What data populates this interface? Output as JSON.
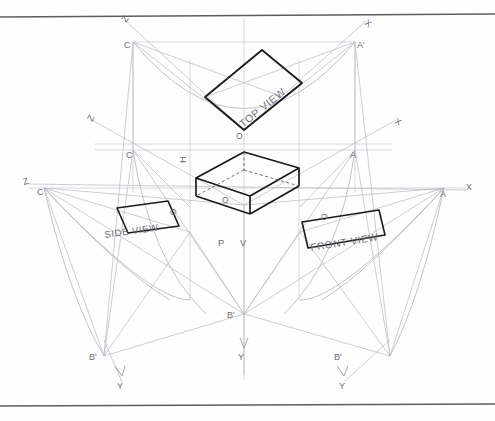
{
  "drawing": {
    "title": "Isometric projection with orthographic views layout",
    "background": "#fefefe",
    "ink": {
      "object": "#1a1a1a",
      "construction": "#9a9aa2",
      "light": "#c3c3c9",
      "label": "#6e6e74",
      "border": "#5c5c62"
    },
    "view_labels": {
      "top": "TOP  VIEW",
      "front": "FRONT  VIEW",
      "side": "SIDE  VIEW"
    },
    "plane_labels": {
      "h": "H",
      "d": "P",
      "v": "V"
    },
    "axis_labels": {
      "z_upper_left": "Z",
      "x_upper_right": "X",
      "z_mid_left": "Z",
      "x_mid_right": "X",
      "z_far_left": "Z",
      "x_far_right": "X",
      "y_center": "Y",
      "y_left": "Y",
      "y_right": "Y"
    },
    "point_labels": {
      "c_top": "C",
      "a_top": "A'",
      "c_mid": "C",
      "a_mid": "A",
      "c_far": "C",
      "a_far": "A",
      "o_top": "O",
      "o_center": "O",
      "o_side": "O",
      "o_front": "O",
      "b_center": "B'",
      "b_left": "B'",
      "b_right": "B'"
    }
  }
}
